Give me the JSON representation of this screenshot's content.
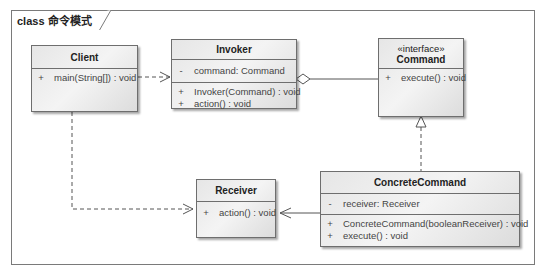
{
  "frame": {
    "title": "class 命令模式"
  },
  "classes": {
    "client": {
      "name": "Client",
      "operations": [
        {
          "vis": "+",
          "text": "main(String[]) : void"
        }
      ]
    },
    "invoker": {
      "name": "Invoker",
      "attributes": [
        {
          "vis": "-",
          "text": "command:  Command"
        }
      ],
      "operations": [
        {
          "vis": "+",
          "text": "Invoker(Command) : void"
        },
        {
          "vis": "+",
          "text": "action() : void"
        }
      ]
    },
    "command": {
      "stereotype": "«interface»",
      "name": "Command",
      "operations": [
        {
          "vis": "+",
          "text": "execute() : void"
        }
      ]
    },
    "receiver": {
      "name": "Receiver",
      "operations": [
        {
          "vis": "+",
          "text": "action() : void"
        }
      ]
    },
    "concrete_command": {
      "name": "ConcreteCommand",
      "attributes": [
        {
          "vis": "-",
          "text": "receiver:  Receiver"
        }
      ],
      "operations": [
        {
          "vis": "+",
          "text": "ConcreteCommand(booleanReceiver) : void"
        },
        {
          "vis": "+",
          "text": "execute() : void"
        }
      ]
    }
  },
  "relationships": [
    {
      "type": "dependency",
      "from": "Client",
      "to": "Invoker"
    },
    {
      "type": "dependency",
      "from": "Client",
      "to": "Receiver"
    },
    {
      "type": "aggregation",
      "from": "Invoker",
      "to": "Command"
    },
    {
      "type": "realization",
      "from": "ConcreteCommand",
      "to": "Command"
    },
    {
      "type": "association",
      "from": "ConcreteCommand",
      "to": "Receiver"
    }
  ]
}
